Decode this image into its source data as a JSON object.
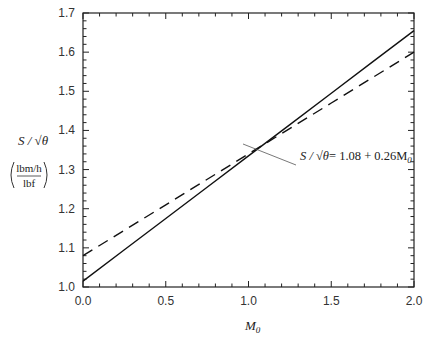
{
  "chart_data": {
    "type": "line",
    "title": "",
    "xlabel": "M",
    "xlabel_subscript": "0",
    "ylabel": "S / √θ",
    "ylabel_units_numerator": "lbm/h",
    "ylabel_units_denominator": "lbf",
    "xlim": [
      0.0,
      2.0
    ],
    "ylim": [
      1.0,
      1.7
    ],
    "x_ticks": [
      "0.0",
      "0.5",
      "1.0",
      "1.5",
      "2.0"
    ],
    "y_ticks": [
      "1.0",
      "1.1",
      "1.2",
      "1.3",
      "1.4",
      "1.5",
      "1.6",
      "1.7"
    ],
    "grid": false,
    "legend": null,
    "series": [
      {
        "name": "exact",
        "style": "solid",
        "x": [
          0.0,
          0.25,
          0.5,
          0.75,
          1.0,
          1.25,
          1.5,
          1.75,
          2.0
        ],
        "values": [
          1.015,
          1.095,
          1.175,
          1.255,
          1.335,
          1.415,
          1.495,
          1.575,
          1.655
        ]
      },
      {
        "name": "linear fit",
        "style": "dashed",
        "x": [
          0.0,
          0.5,
          1.0,
          1.5,
          2.0
        ],
        "values": [
          1.08,
          1.21,
          1.34,
          1.47,
          1.6
        ]
      }
    ],
    "annotations": [
      {
        "text": "S / √θ = 1.08 + 0.26M₀",
        "points_to": "linear fit",
        "x": 0.95,
        "y": 1.33
      }
    ]
  },
  "labels": {
    "annotation_lhs": "S / √θ",
    "annotation_rhs": "= 1.08 + 0.26M",
    "annotation_sub": "0",
    "ylabel_main": "S / √θ",
    "ylabel_num": "lbm/h",
    "ylabel_den": "lbf",
    "xlabel_main": "M",
    "xlabel_sub": "0"
  }
}
